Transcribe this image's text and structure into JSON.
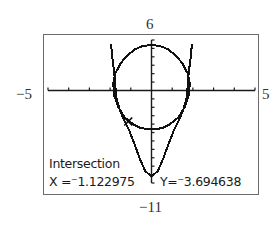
{
  "chart_data": {
    "type": "line",
    "title": "",
    "xlabel": "",
    "ylabel": "",
    "window": {
      "xmin": -5,
      "xmax": 5,
      "ymin": -11,
      "ymax": 6,
      "xscl": 1,
      "yscl": 1
    },
    "tick_labels": {
      "top": "6",
      "left": "−5",
      "right": "5",
      "bottom": "−11"
    },
    "grid": false,
    "series": [
      {
        "name": "ellipse-upper",
        "points": [
          [
            -1.85,
            0.8
          ],
          [
            -1.75,
            2.0
          ],
          [
            -1.5,
            3.2
          ],
          [
            -1.2,
            4.1
          ],
          [
            -0.8,
            4.9
          ],
          [
            -0.4,
            5.3
          ],
          [
            0,
            5.4
          ],
          [
            0.4,
            5.3
          ],
          [
            0.8,
            4.9
          ],
          [
            1.2,
            4.1
          ],
          [
            1.5,
            3.2
          ],
          [
            1.75,
            2.0
          ],
          [
            1.85,
            0.8
          ]
        ]
      },
      {
        "name": "ellipse-lower",
        "points": [
          [
            -1.85,
            0.8
          ],
          [
            -1.8,
            -0.6
          ],
          [
            -1.6,
            -2.0
          ],
          [
            -1.3,
            -3.2
          ],
          [
            -0.9,
            -4.0
          ],
          [
            -0.5,
            -4.5
          ],
          [
            0,
            -4.6
          ],
          [
            0.5,
            -4.5
          ],
          [
            0.9,
            -4.0
          ],
          [
            1.3,
            -3.2
          ],
          [
            1.6,
            -2.0
          ],
          [
            1.8,
            -0.6
          ],
          [
            1.85,
            0.8
          ]
        ]
      },
      {
        "name": "parabola",
        "points": [
          [
            -1.95,
            5.5
          ],
          [
            -1.9,
            4.0
          ],
          [
            -1.8,
            2.2
          ],
          [
            -1.75,
            0.6
          ],
          [
            -1.7,
            -0.8
          ],
          [
            -1.55,
            -2.2
          ],
          [
            -1.35,
            -3.4
          ],
          [
            -1.1,
            -4.6
          ],
          [
            -0.85,
            -6.2
          ],
          [
            -0.55,
            -8.2
          ],
          [
            -0.3,
            -9.6
          ],
          [
            0,
            -10.2
          ],
          [
            0.3,
            -9.6
          ],
          [
            0.55,
            -8.2
          ],
          [
            0.85,
            -6.2
          ],
          [
            1.1,
            -4.6
          ],
          [
            1.35,
            -3.4
          ],
          [
            1.55,
            -2.2
          ],
          [
            1.7,
            -0.8
          ],
          [
            1.75,
            0.6
          ],
          [
            1.8,
            2.2
          ],
          [
            1.9,
            4.0
          ],
          [
            1.95,
            5.5
          ]
        ]
      }
    ],
    "intersection": {
      "x": -1.122975,
      "y": -3.694638
    }
  },
  "readout": {
    "title": "Intersection",
    "x_text": "X =⁻1.122975",
    "y_text": "Y=⁻3.694638"
  },
  "colors": {
    "curve": "#111111",
    "axis": "#1a1a1a",
    "frame": "#6b6b6b"
  }
}
